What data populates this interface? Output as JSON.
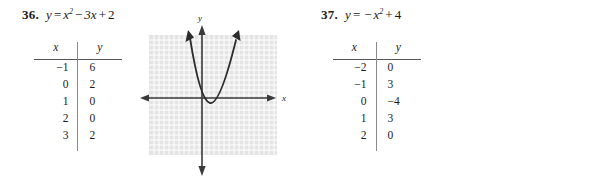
{
  "page": {
    "background_color": "#ffffff",
    "text_color": "#1a1a1a"
  },
  "problems": [
    {
      "number": "36.",
      "equation": {
        "lhs": "y",
        "equals": "=",
        "base": "x",
        "exponent": "2",
        "term2_op": "−",
        "term2": "3x",
        "term3_op": "+",
        "term3": "2",
        "full_text": "y = x² − 3x + 2"
      },
      "table": {
        "headers": [
          "x",
          "y"
        ],
        "rows": [
          [
            "−1",
            "6"
          ],
          [
            "0",
            "2"
          ],
          [
            "1",
            "0"
          ],
          [
            "2",
            "0"
          ],
          [
            "3",
            "2"
          ]
        ]
      },
      "graph": {
        "x_axis_label": "x",
        "y_axis_label": "y",
        "grid": true,
        "grid_color": "#e4e4e4",
        "gridline_color": "#ffffff",
        "curve_color": "#2b2b2b",
        "axis_color": "#3a3a3a",
        "curve_type": "parabola",
        "opens": "up",
        "description": "upward opening parabola with vertex just below the x-axis, slightly right of the y-axis"
      }
    },
    {
      "number": "37.",
      "equation": {
        "lhs": "y",
        "equals": "=",
        "leading_op": "−",
        "base": "x",
        "exponent": "2",
        "term2_op": "+",
        "term2": "4",
        "full_text": "y = −x² + 4"
      },
      "table": {
        "headers": [
          "x",
          "y"
        ],
        "rows": [
          [
            "−2",
            "0"
          ],
          [
            "−1",
            "3"
          ],
          [
            "0",
            "−4"
          ],
          [
            "1",
            "3"
          ],
          [
            "2",
            "0"
          ]
        ]
      },
      "graph": {
        "x_axis_label": "x",
        "y_axis_label": "y",
        "grid": true,
        "grid_color": "#e4e4e4",
        "gridline_color": "#ffffff",
        "curve_color": "#2b2b2b",
        "axis_color": "#3a3a3a",
        "curve_type": "parabola",
        "opens": "down",
        "description": "downward opening parabola with vertex above the x-axis on the y-axis"
      }
    }
  ]
}
